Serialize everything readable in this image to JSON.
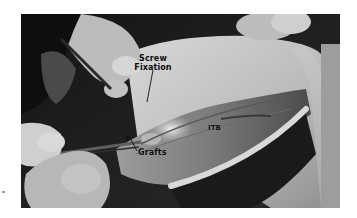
{
  "image": {
    "description": "Grayscale intraoperative photograph of a surgical procedure showing gloved hands, instruments, exposed tissue and the iliotibial band, with annotation labels",
    "colors": {
      "background": "#ffffff",
      "label_text": "#0a0a0a",
      "pointer_lines": "#111111"
    }
  },
  "annotations": {
    "screw_fixation": "Screw Fixation",
    "screw_line1": "Screw",
    "screw_line2": "Fixation",
    "itb": "ITB",
    "grafts": "Grafts"
  }
}
